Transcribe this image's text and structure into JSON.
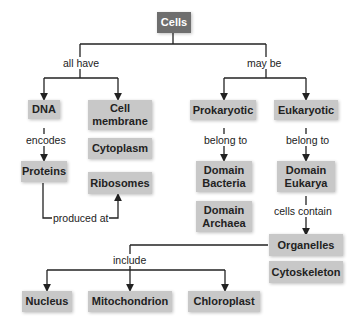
{
  "nodes": {
    "cells": "Cells",
    "dna": "DNA",
    "cell_membrane": "Cell membrane",
    "cytoplasm": "Cytoplasm",
    "ribosomes": "Ribosomes",
    "proteins": "Proteins",
    "prokaryotic": "Prokaryotic",
    "eukaryotic": "Eukaryotic",
    "domain_bacteria": "Domain Bacteria",
    "domain_archaea": "Domain Archaea",
    "domain_eukarya": "Domain Eukarya",
    "organelles": "Organelles",
    "cytoskeleton": "Cytoskeleton",
    "nucleus": "Nucleus",
    "mitochondrion": "Mitochondrion",
    "chloroplast": "Chloroplast"
  },
  "edges": {
    "all_have": "all have",
    "may_be": "may be",
    "encodes": "encodes",
    "produced_at": "produced at",
    "belong_to_prok": "belong to",
    "belong_to_euk": "belong to",
    "cells_contain": "cells contain",
    "include": "include"
  },
  "colors": {
    "root_box": "#6e6e6e",
    "node_box": "#c8c8c8",
    "line": "#222222"
  }
}
